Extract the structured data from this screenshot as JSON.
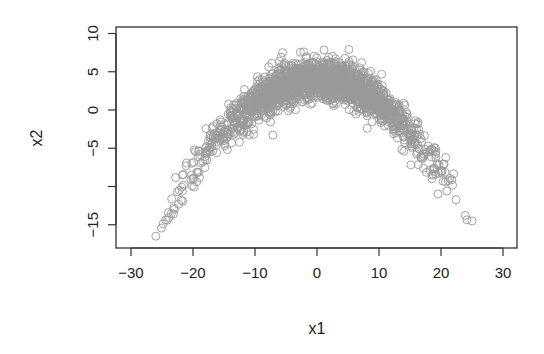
{
  "chart_data": {
    "type": "scatter",
    "title": "",
    "xlabel": "x1",
    "ylabel": "x2",
    "xlim": [
      -31,
      33
    ],
    "ylim": [
      -18,
      11
    ],
    "grid": false,
    "legend": null,
    "x_ticks": [
      {
        "value": -30,
        "label": "−30"
      },
      {
        "value": -20,
        "label": "−20"
      },
      {
        "value": -10,
        "label": "−10"
      },
      {
        "value": 0,
        "label": "0"
      },
      {
        "value": 10,
        "label": "10"
      },
      {
        "value": 20,
        "label": "20"
      },
      {
        "value": 30,
        "label": "30"
      }
    ],
    "y_ticks": [
      {
        "value": -15,
        "label": "−15"
      },
      {
        "value": -10,
        "label": ""
      },
      {
        "value": -5,
        "label": "−5"
      },
      {
        "value": 0,
        "label": "0"
      },
      {
        "value": 5,
        "label": "5"
      },
      {
        "value": 10,
        "label": "10"
      }
    ],
    "series": [
      {
        "name": "points",
        "marker": "open-circle",
        "color": "#9a9a9a",
        "description": "Dense cloud of roughly 2000 points following an inverted parabola x2 ≈ 4 − 0.03·x1² with noise; x1 spans about −26 to 25, x2 peaks near 6 at x1≈0 and falls to about −17 at x1≈−26 and −14 at x1≈25",
        "generator": {
          "n": 2000,
          "x_sd": 9,
          "x_range": [
            -26,
            25
          ],
          "curve": {
            "a": 4,
            "b": -0.03
          },
          "noise_sd": 1.3,
          "seed": 7
        },
        "sample_points": [
          {
            "x": -26,
            "y": -16.5
          },
          {
            "x": -23,
            "y": -13
          },
          {
            "x": -20,
            "y": -9
          },
          {
            "x": -15,
            "y": -4
          },
          {
            "x": -10,
            "y": 0.5
          },
          {
            "x": -5,
            "y": 3
          },
          {
            "x": 0,
            "y": 4
          },
          {
            "x": 5,
            "y": 3.5
          },
          {
            "x": 10,
            "y": 1
          },
          {
            "x": 15,
            "y": -3
          },
          {
            "x": 20,
            "y": -8
          },
          {
            "x": 25,
            "y": -14.5
          }
        ]
      }
    ]
  },
  "plot_frame": {
    "left": 116,
    "top": 27,
    "right": 517,
    "bottom": 248
  }
}
